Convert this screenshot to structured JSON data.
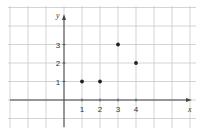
{
  "chart_data": {
    "type": "scatter",
    "title": "",
    "xlabel": "x",
    "ylabel": "y",
    "x": [
      1,
      2,
      3,
      4
    ],
    "y": [
      1,
      1,
      3,
      2
    ],
    "points": [
      {
        "x": 1,
        "y": 1
      },
      {
        "x": 2,
        "y": 1
      },
      {
        "x": 3,
        "y": 3
      },
      {
        "x": 4,
        "y": 2
      }
    ],
    "x_ticks": [
      "1",
      "2",
      "3",
      "4"
    ],
    "y_ticks": [
      "1",
      "2",
      "3"
    ],
    "xlim": [
      -3.5,
      7
    ],
    "ylim": [
      -1.5,
      5
    ],
    "grid": true,
    "legend": null
  },
  "colors": {
    "grid": "#c8c8c8",
    "axis": "#444444",
    "point": "#222222"
  }
}
